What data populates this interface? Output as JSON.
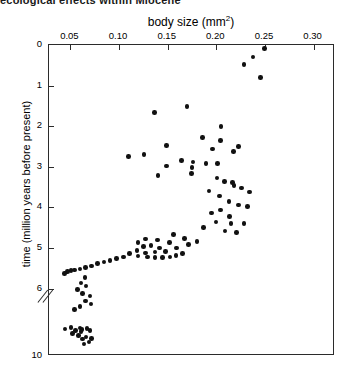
{
  "clipped_heading": "ecological effects within Miocene",
  "chart_data": {
    "type": "scatter",
    "title": "",
    "xlabel": "body size (mm²)",
    "xlabel_base": "body size (mm",
    "xlabel_sup": "2",
    "xlabel_close": ")",
    "ylabel": "time (million years before present)",
    "xlim": [
      0.028,
      0.322
    ],
    "ylim": [
      0,
      10
    ],
    "y_axis_inverted": true,
    "y_axis_break": true,
    "y_axis_break_between": [
      6.6,
      9.0
    ],
    "grid": false,
    "legend": null,
    "xticks": [
      0.05,
      0.1,
      0.15,
      0.2,
      0.25,
      0.3
    ],
    "xticklabels": [
      "0.05",
      "0.10",
      "0.15",
      "0.20",
      "0.25",
      "0.30"
    ],
    "yticks": [
      0,
      1,
      2,
      3,
      4,
      5,
      6,
      10
    ],
    "yticklabels": [
      "0",
      "1",
      "2",
      "3",
      "4",
      "5",
      "6",
      "10"
    ],
    "marker": "filled-circle",
    "marker_color": "#111111",
    "points": [
      {
        "x": 0.2495,
        "y": 0.08
      },
      {
        "x": 0.2375,
        "y": 0.3
      },
      {
        "x": 0.2285,
        "y": 0.48
      },
      {
        "x": 0.2455,
        "y": 0.8
      },
      {
        "x": 0.17,
        "y": 1.52
      },
      {
        "x": 0.1365,
        "y": 1.66
      },
      {
        "x": 0.205,
        "y": 2.0
      },
      {
        "x": 0.186,
        "y": 2.28
      },
      {
        "x": 0.2045,
        "y": 2.35
      },
      {
        "x": 0.149,
        "y": 2.47
      },
      {
        "x": 0.196,
        "y": 2.56
      },
      {
        "x": 0.223,
        "y": 2.5
      },
      {
        "x": 0.2175,
        "y": 2.62
      },
      {
        "x": 0.11,
        "y": 2.74
      },
      {
        "x": 0.1255,
        "y": 2.7
      },
      {
        "x": 0.164,
        "y": 2.85
      },
      {
        "x": 0.176,
        "y": 2.88
      },
      {
        "x": 0.1895,
        "y": 2.92
      },
      {
        "x": 0.201,
        "y": 2.92
      },
      {
        "x": 0.149,
        "y": 2.98
      },
      {
        "x": 0.175,
        "y": 3.02
      },
      {
        "x": 0.1745,
        "y": 3.16
      },
      {
        "x": 0.14,
        "y": 3.22
      },
      {
        "x": 0.2005,
        "y": 3.28
      },
      {
        "x": 0.2085,
        "y": 3.36
      },
      {
        "x": 0.2165,
        "y": 3.38
      },
      {
        "x": 0.218,
        "y": 3.46
      },
      {
        "x": 0.226,
        "y": 3.52
      },
      {
        "x": 0.1925,
        "y": 3.6
      },
      {
        "x": 0.234,
        "y": 3.62
      },
      {
        "x": 0.203,
        "y": 3.72
      },
      {
        "x": 0.213,
        "y": 3.86
      },
      {
        "x": 0.2225,
        "y": 3.94
      },
      {
        "x": 0.232,
        "y": 3.98
      },
      {
        "x": 0.2045,
        "y": 4.06
      },
      {
        "x": 0.195,
        "y": 4.14
      },
      {
        "x": 0.2135,
        "y": 4.22
      },
      {
        "x": 0.1995,
        "y": 4.36
      },
      {
        "x": 0.215,
        "y": 4.4
      },
      {
        "x": 0.2285,
        "y": 4.4
      },
      {
        "x": 0.187,
        "y": 4.5
      },
      {
        "x": 0.209,
        "y": 4.58
      },
      {
        "x": 0.221,
        "y": 4.62
      },
      {
        "x": 0.156,
        "y": 4.66
      },
      {
        "x": 0.167,
        "y": 4.76
      },
      {
        "x": 0.18,
        "y": 4.84
      },
      {
        "x": 0.1715,
        "y": 4.92
      },
      {
        "x": 0.159,
        "y": 5.0
      },
      {
        "x": 0.152,
        "y": 4.86
      },
      {
        "x": 0.1395,
        "y": 4.8
      },
      {
        "x": 0.1275,
        "y": 4.78
      },
      {
        "x": 0.1195,
        "y": 4.86
      },
      {
        "x": 0.125,
        "y": 4.96
      },
      {
        "x": 0.133,
        "y": 4.94
      },
      {
        "x": 0.1415,
        "y": 5.0
      },
      {
        "x": 0.148,
        "y": 5.08
      },
      {
        "x": 0.137,
        "y": 5.1
      },
      {
        "x": 0.127,
        "y": 5.12
      },
      {
        "x": 0.1185,
        "y": 5.06
      },
      {
        "x": 0.1105,
        "y": 5.14
      },
      {
        "x": 0.1195,
        "y": 5.2
      },
      {
        "x": 0.129,
        "y": 5.22
      },
      {
        "x": 0.137,
        "y": 5.24
      },
      {
        "x": 0.1445,
        "y": 5.24
      },
      {
        "x": 0.1525,
        "y": 5.22
      },
      {
        "x": 0.1585,
        "y": 5.18
      },
      {
        "x": 0.165,
        "y": 5.14
      },
      {
        "x": 0.1045,
        "y": 5.22
      },
      {
        "x": 0.0975,
        "y": 5.26
      },
      {
        "x": 0.0905,
        "y": 5.3
      },
      {
        "x": 0.0845,
        "y": 5.34
      },
      {
        "x": 0.078,
        "y": 5.38
      },
      {
        "x": 0.0715,
        "y": 5.44
      },
      {
        "x": 0.0655,
        "y": 5.48
      },
      {
        "x": 0.06,
        "y": 5.52
      },
      {
        "x": 0.0545,
        "y": 5.54
      },
      {
        "x": 0.0505,
        "y": 5.56
      },
      {
        "x": 0.047,
        "y": 5.58
      },
      {
        "x": 0.044,
        "y": 5.62
      },
      {
        "x": 0.065,
        "y": 5.72
      },
      {
        "x": 0.061,
        "y": 5.86
      },
      {
        "x": 0.066,
        "y": 5.94
      },
      {
        "x": 0.0575,
        "y": 6.02
      },
      {
        "x": 0.0625,
        "y": 6.12
      },
      {
        "x": 0.07,
        "y": 6.18
      },
      {
        "x": 0.0655,
        "y": 6.3
      },
      {
        "x": 0.071,
        "y": 6.38
      },
      {
        "x": 0.06,
        "y": 6.44
      },
      {
        "x": 0.0545,
        "y": 6.52
      },
      {
        "x": 0.0505,
        "y": 8.56
      },
      {
        "x": 0.06,
        "y": 8.62
      },
      {
        "x": 0.0445,
        "y": 8.72
      },
      {
        "x": 0.067,
        "y": 8.7
      },
      {
        "x": 0.062,
        "y": 8.8
      },
      {
        "x": 0.0555,
        "y": 8.9
      },
      {
        "x": 0.07,
        "y": 8.92
      },
      {
        "x": 0.061,
        "y": 9.02
      },
      {
        "x": 0.052,
        "y": 9.1
      },
      {
        "x": 0.0585,
        "y": 9.18
      },
      {
        "x": 0.066,
        "y": 9.24
      },
      {
        "x": 0.0625,
        "y": 9.32
      },
      {
        "x": 0.0715,
        "y": 9.3
      },
      {
        "x": 0.069,
        "y": 9.44
      },
      {
        "x": 0.064,
        "y": 9.52
      }
    ]
  }
}
